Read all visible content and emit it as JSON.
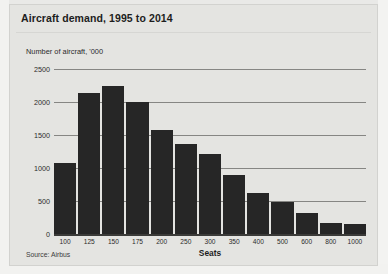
{
  "panel": {
    "title": "Aircraft demand, 1995 to 2014",
    "subtitle": "Number of aircraft, '000",
    "source": "Source: Airbus"
  },
  "colors": {
    "bar": "#262626",
    "panel_background": "#e4e4e1",
    "page_background": "#e9e9e7",
    "gridline": "#868683",
    "axis": "#3a3a38",
    "text": "#1d1d1d"
  },
  "chart_data": {
    "type": "bar",
    "title": "Aircraft demand, 1995 to 2014",
    "subtitle": "Number of aircraft, '000",
    "xlabel": "Seats",
    "ylabel": "Number of aircraft, '000",
    "source": "Source: Airbus",
    "categories": [
      "100",
      "125",
      "150",
      "175",
      "200",
      "250",
      "300",
      "350",
      "400",
      "500",
      "600",
      "800",
      "1000"
    ],
    "values": [
      1080,
      2130,
      2250,
      2000,
      1580,
      1370,
      1210,
      890,
      620,
      480,
      320,
      160,
      150
    ],
    "ylim": [
      0,
      2500
    ],
    "yticks": [
      0,
      500,
      1000,
      1500,
      2000,
      2500
    ],
    "ytick_labels": [
      "0",
      "500",
      "1000",
      "1500",
      "2000",
      "2500"
    ],
    "grid": true,
    "legend": null
  }
}
